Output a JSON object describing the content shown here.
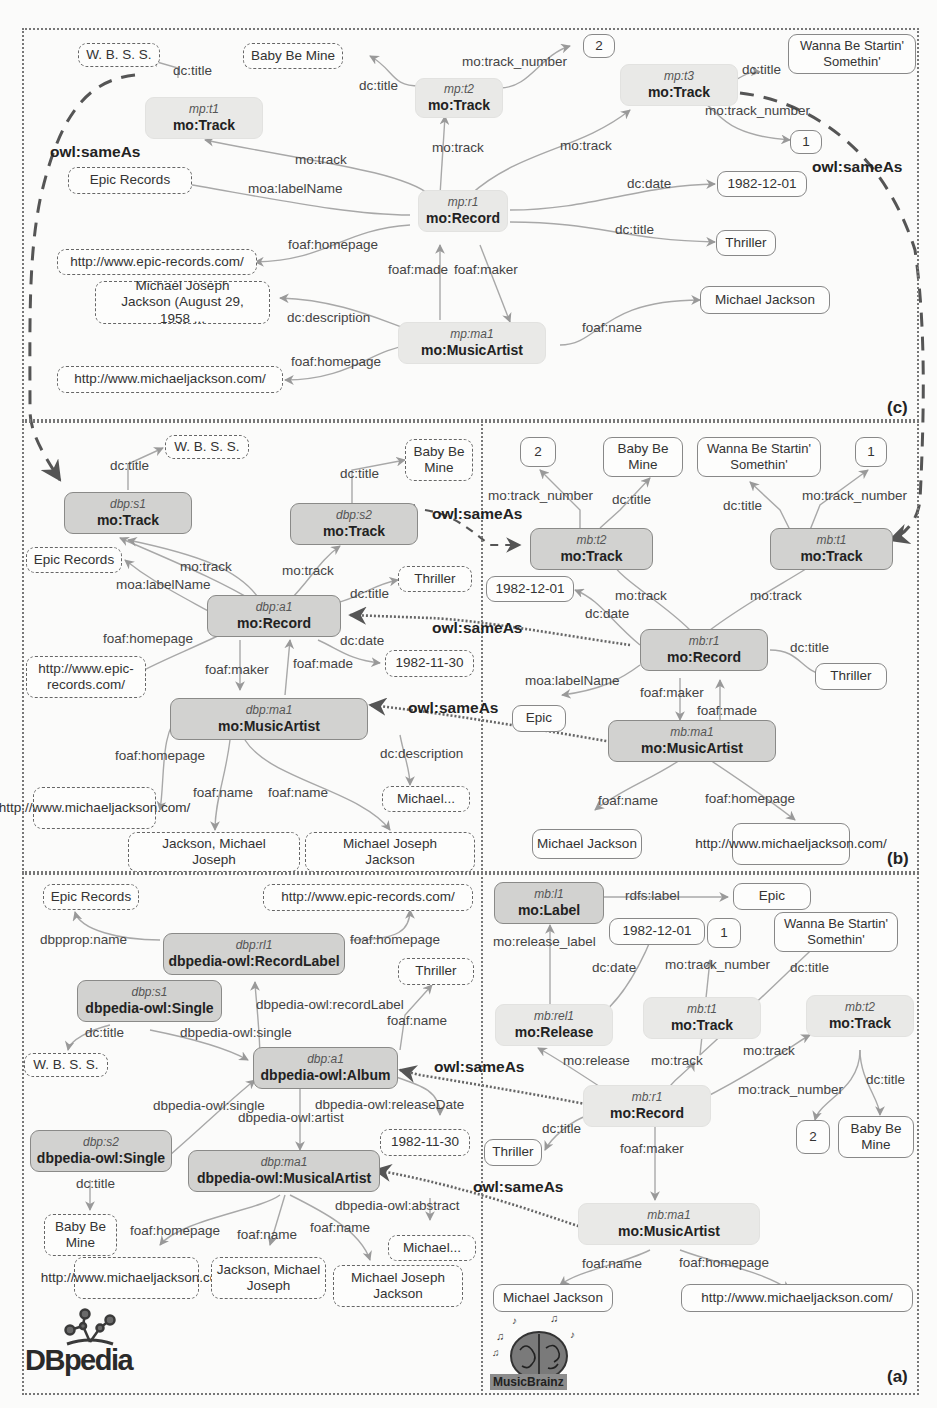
{
  "figure": {
    "panels": [
      {
        "id": "c",
        "label": "(c)"
      },
      {
        "id": "b",
        "label": "(b)"
      },
      {
        "id": "a",
        "label": "(a)"
      }
    ],
    "same_as_label": "owl:sameAs",
    "logos": {
      "dbpedia": "DBpedia",
      "musicbrainz": "MusicBrainz"
    }
  },
  "panel_c": {
    "nodes": {
      "t1": {
        "id": "mp:t1",
        "cls": "mo:Track"
      },
      "t2": {
        "id": "mp:t2",
        "cls": "mo:Track"
      },
      "t3": {
        "id": "mp:t3",
        "cls": "mo:Track"
      },
      "r1": {
        "id": "mp:r1",
        "cls": "mo:Record"
      },
      "ma1": {
        "id": "mp:ma1",
        "cls": "mo:MusicArtist"
      }
    },
    "literals": {
      "wbss": "W. B. S. S.",
      "baby": "Baby Be Mine",
      "two": "2",
      "wanna": "Wanna Be Startin' Somethin'",
      "one": "1",
      "epic": "Epic Records",
      "date": "1982-12-01",
      "thriller": "Thriller",
      "epic_url": "http://www.epic-records.com/",
      "desc": "Michael Joseph Jackson (August 29, 1958 ...",
      "mj": "Michael Jackson",
      "mj_url": "http://www.michaeljackson.com/"
    },
    "edges": {
      "t1_title": "dc:title",
      "t2_title": "dc:title",
      "t2_num": "mo:track_number",
      "t3_title": "dc:title",
      "t3_num": "mo:track_number",
      "r1_t1": "mo:track",
      "r1_t2": "mo:track",
      "r1_t3": "mo:track",
      "label": "moa:labelName",
      "date": "dc:date",
      "title": "dc:title",
      "homepage": "foaf:homepage",
      "made": "foaf:made",
      "maker": "foaf:maker",
      "desc": "dc:description",
      "name": "foaf:name",
      "ma_homepage": "foaf:homepage"
    }
  },
  "panel_b_dbp": {
    "nodes": {
      "s1": {
        "id": "dbp:s1",
        "cls": "mo:Track"
      },
      "s2": {
        "id": "dbp:s2",
        "cls": "mo:Track"
      },
      "a1": {
        "id": "dbp:a1",
        "cls": "mo:Record"
      },
      "ma1": {
        "id": "dbp:ma1",
        "cls": "mo:MusicArtist"
      }
    },
    "literals": {
      "wbss": "W. B. S. S.",
      "baby": "Baby Be Mine",
      "epic": "Epic Records",
      "thriller": "Thriller",
      "epic_url": "http://www.epic-records.com/",
      "date": "1982-11-30",
      "mj_url": "http://www.michaeljackson.com/",
      "michael": "Michael...",
      "name1": "Jackson, Michael Joseph",
      "name2": "Michael Joseph Jackson"
    },
    "edges": {
      "s1_title": "dc:title",
      "s2_title": "dc:title",
      "a1_s1": "mo:track",
      "a1_s2": "mo:track",
      "label": "moa:labelName",
      "title": "dc:title",
      "homepage": "foaf:homepage",
      "date": "dc:date",
      "maker": "foaf:maker",
      "made": "foaf:made",
      "ma_homepage": "foaf:homepage",
      "desc": "dc:description",
      "name1": "foaf:name",
      "name2": "foaf:name"
    }
  },
  "panel_b_mb": {
    "nodes": {
      "t2": {
        "id": "mb:t2",
        "cls": "mo:Track"
      },
      "t1": {
        "id": "mb:t1",
        "cls": "mo:Track"
      },
      "r1": {
        "id": "mb:r1",
        "cls": "mo:Record"
      },
      "ma1": {
        "id": "mb:ma1",
        "cls": "mo:MusicArtist"
      }
    },
    "literals": {
      "two": "2",
      "baby": "Baby Be Mine",
      "wanna": "Wanna Be Startin' Somethin'",
      "one": "1",
      "date": "1982-12-01",
      "thriller": "Thriller",
      "epic": "Epic",
      "mj": "Michael Jackson",
      "mj_url": "http://www.michaeljackson.com/"
    },
    "edges": {
      "t2_num": "mo:track_number",
      "t2_title": "dc:title",
      "t1_title": "dc:title",
      "t1_num": "mo:track_number",
      "r1_t2": "mo:track",
      "r1_t1": "mo:track",
      "date": "dc:date",
      "title": "dc:title",
      "label": "moa:labelName",
      "maker": "foaf:maker",
      "made": "foaf:made",
      "name": "foaf:name",
      "homepage": "foaf:homepage"
    }
  },
  "panel_a_dbp": {
    "nodes": {
      "rl1": {
        "id": "dbp:rl1",
        "cls": "dbpedia-owl:RecordLabel"
      },
      "s1": {
        "id": "dbp:s1",
        "cls": "dbpedia-owl:Single"
      },
      "a1": {
        "id": "dbp:a1",
        "cls": "dbpedia-owl:Album"
      },
      "s2": {
        "id": "dbp:s2",
        "cls": "dbpedia-owl:Single"
      },
      "ma1": {
        "id": "dbp:ma1",
        "cls": "dbpedia-owl:MusicalArtist"
      }
    },
    "literals": {
      "epic": "Epic Records",
      "epic_url": "http://www.epic-records.com/",
      "thriller": "Thriller",
      "wbss": "W. B. S. S.",
      "date": "1982-11-30",
      "baby": "Baby Be Mine",
      "mj_url": "http://www.michaeljackson.com/",
      "name1": "Jackson, Michael Joseph",
      "name2": "Michael Joseph Jackson",
      "michael": "Michael..."
    },
    "edges": {
      "rl_name": "dbpprop:name",
      "rl_homepage": "foaf:homepage",
      "record_label": "dbpedia-owl:recordLabel",
      "a1_name": "foaf:name",
      "s1_title": "dc:title",
      "s1_single": "dbpedia-owl:single",
      "s2_single": "dbpedia-owl:single",
      "artist": "dbpedia-owl:artist",
      "release_date": "dbpedia-owl:releaseDate",
      "s2_title": "dc:title",
      "abstract": "dbpedia-owl:abstract",
      "ma_homepage": "foaf:homepage",
      "name1": "foaf:name",
      "name2": "foaf:name"
    }
  },
  "panel_a_mb": {
    "nodes": {
      "l1": {
        "id": "mb:l1",
        "cls": "mo:Label"
      },
      "rel1": {
        "id": "mb:rel1",
        "cls": "mo:Release"
      },
      "t1": {
        "id": "mb:t1",
        "cls": "mo:Track"
      },
      "t2": {
        "id": "mb:t2",
        "cls": "mo:Track"
      },
      "r1": {
        "id": "mb:r1",
        "cls": "mo:Record"
      },
      "ma1": {
        "id": "mb:ma1",
        "cls": "mo:MusicArtist"
      }
    },
    "literals": {
      "epic": "Epic",
      "date": "1982-12-01",
      "one": "1",
      "wanna": "Wanna Be Startin' Somethin'",
      "thriller": "Thriller",
      "two": "2",
      "baby": "Baby Be Mine",
      "mj": "Michael Jackson",
      "mj_url": "http://www.michaeljackson.com/"
    },
    "edges": {
      "rdfs_label": "rdfs:label",
      "release_label": "mo:release_label",
      "date": "dc:date",
      "t1_num": "mo:track_number",
      "t1_title": "dc:title",
      "release": "mo:release",
      "r1_t1": "mo:track",
      "r1_t2": "mo:track",
      "t2_num": "mo:track_number",
      "t2_title": "dc:title",
      "title": "dc:title",
      "maker": "foaf:maker",
      "name": "foaf:name",
      "homepage": "foaf:homepage"
    }
  }
}
